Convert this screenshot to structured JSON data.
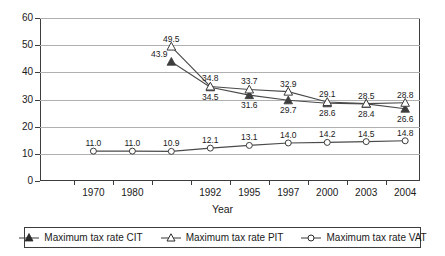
{
  "chart_data": {
    "type": "line",
    "title": "",
    "xlabel": "Year",
    "ylabel": "",
    "ylim": [
      0,
      60
    ],
    "ytick_step": 10,
    "yticks": [
      "0",
      "10",
      "20",
      "30",
      "40",
      "50",
      "60"
    ],
    "grid": true,
    "legend_position": "bottom",
    "categories": [
      "1970",
      "1980",
      "1990",
      "1992",
      "1995",
      "1997",
      "2000",
      "2003",
      "2004"
    ],
    "tick_labels_shown": [
      "1970",
      "1980",
      "1992",
      "1995",
      "1997",
      "2000",
      "2003",
      "2004"
    ],
    "series": [
      {
        "name": "Maximum tax rate CIT",
        "marker": "filled-triangle",
        "values": [
          null,
          null,
          43.9,
          34.5,
          31.6,
          29.7,
          28.6,
          28.4,
          26.6
        ],
        "point_labels": [
          "",
          "",
          "43.9",
          "34.5",
          "31.6",
          "29.7",
          "28.6",
          "28.4",
          "26.6"
        ]
      },
      {
        "name": "Maximum tax rate PIT",
        "marker": "open-triangle",
        "values": [
          null,
          null,
          49.5,
          34.8,
          33.7,
          32.9,
          29.1,
          28.5,
          28.8
        ],
        "point_labels": [
          "",
          "",
          "49.5",
          "34.8",
          "33.7",
          "32.9",
          "29.1",
          "28.5",
          "28.8"
        ]
      },
      {
        "name": "Maximum tax rate VAT",
        "marker": "open-circle",
        "values": [
          11.0,
          11.0,
          10.9,
          12.1,
          13.1,
          14.0,
          14.2,
          14.5,
          14.8
        ],
        "point_labels": [
          "11.0",
          "11.0",
          "10.9",
          "12.1",
          "13.1",
          "14.0",
          "14.2",
          "14.5",
          "14.8"
        ]
      }
    ]
  },
  "colors": {
    "axis": "#3d3d3d",
    "gridline": "#b0b0b0",
    "series_line": "#4a4a4a",
    "marker_fill": "#3d3d3d",
    "marker_open": "#ffffff",
    "text": "#1a1a1a",
    "background": "#ffffff"
  },
  "axis": {
    "x_title": "Year"
  },
  "legend": {
    "entries": [
      {
        "label": "Maximum tax rate CIT",
        "icon": "filled-triangle-marker-icon"
      },
      {
        "label": "Maximum tax rate PIT",
        "icon": "open-triangle-marker-icon"
      },
      {
        "label": "Maximum tax rate VAT",
        "icon": "open-circle-marker-icon"
      }
    ]
  }
}
